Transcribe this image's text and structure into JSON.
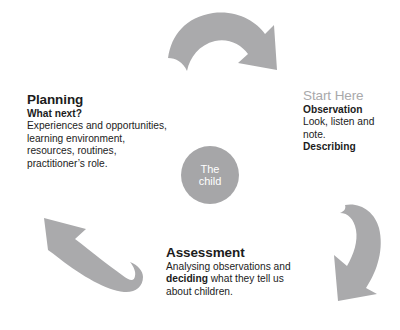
{
  "diagram": {
    "background_color": "#ffffff",
    "arrow_color": "#aaaaac",
    "circle_color": "#a6a6a8",
    "text_color": "#1c1c1c",
    "muted_color": "#a9a9ab"
  },
  "center": {
    "line1": "The",
    "line2": "child"
  },
  "stages": {
    "observation": {
      "start_label": "Start Here",
      "heading": "Observation",
      "body": "Look, listen and note.",
      "emphasis": "Describing"
    },
    "planning": {
      "heading": "Planning",
      "subheading": "What next?",
      "body": "Experiences and opportunities, learning environment, resources, routines, practitioner’s role."
    },
    "assessment": {
      "heading": "Assessment",
      "body_part1": "Analysing observations and ",
      "body_emphasis": "deciding",
      "body_part2": " what they tell us about children."
    }
  },
  "arrows": [
    {
      "name": "arrow-top-to-observation",
      "direction": "clockwise-top"
    },
    {
      "name": "arrow-observation-to-assessment",
      "direction": "clockwise-right"
    },
    {
      "name": "arrow-assessment-to-planning",
      "direction": "clockwise-left"
    }
  ]
}
